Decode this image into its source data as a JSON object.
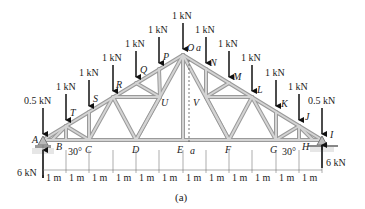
{
  "figure": {
    "caption": "(a)",
    "colors": {
      "member": "#c9c9c9",
      "member_edge": "#8a8a8a",
      "arrow": "#111111",
      "text": "#222222",
      "ground": "#bdbdbd"
    }
  },
  "joints": {
    "A": "A",
    "B": "B",
    "C": "C",
    "D": "D",
    "E": "E",
    "F": "F",
    "G": "G",
    "H": "H",
    "I": "I",
    "J": "J",
    "K": "K",
    "L": "L",
    "M": "M",
    "N": "N",
    "O": "O",
    "P": "P",
    "Q": "Q",
    "R": "R",
    "S": "S",
    "T": "T",
    "U": "U",
    "V": "V"
  },
  "section_labels": {
    "top": "a",
    "bottom": "a"
  },
  "loads": {
    "A": "0.5 kN",
    "T": "1 kN",
    "S": "1 kN",
    "R": "1 kN",
    "Q": "1 kN",
    "P": "1 kN",
    "O": "1 kN",
    "N": "1 kN",
    "M": "1 kN",
    "L": "1 kN",
    "K": "1 kN",
    "J": "1 kN",
    "I": "0.5 kN"
  },
  "reactions": {
    "left": "6 kN",
    "right": "6 kN"
  },
  "angles": {
    "left": "30°",
    "right": "30°"
  },
  "dimensions": [
    "1 m",
    "1 m",
    "1 m",
    "1 m",
    "1 m",
    "1 m",
    "1 m",
    "1 m",
    "1 m",
    "1 m",
    "1 m",
    "1 m"
  ]
}
